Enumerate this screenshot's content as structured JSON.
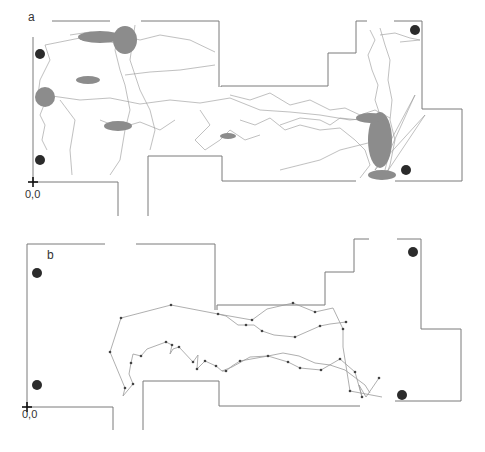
{
  "figure": {
    "panels": [
      {
        "id": "a",
        "label": "a",
        "origin_label": "0,0",
        "description": "Dense exploration trajectory with many sampled points across the arena"
      },
      {
        "id": "b",
        "label": "b",
        "origin_label": "0,0",
        "description": "Sparse single trajectory path through the central corridor"
      }
    ],
    "colors": {
      "wall": "#7a7a7a",
      "trajectory_a": "#8c8c8c",
      "trajectory_b": "#9a9a9a",
      "points_b": "#444444",
      "landmark": "#2b2b2b",
      "origin": "#111111"
    }
  }
}
